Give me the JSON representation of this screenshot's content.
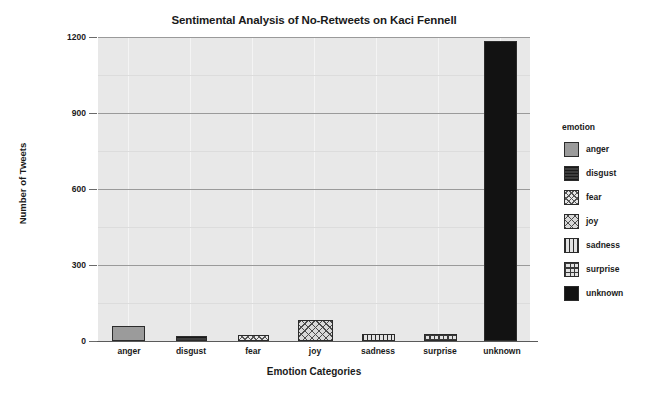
{
  "chart_data": {
    "type": "bar",
    "title": "Sentimental Analysis of No-Retweets on Kaci Fennell",
    "xlabel": "Emotion Categories",
    "ylabel": "Number of Tweets",
    "categories": [
      "anger",
      "disgust",
      "fear",
      "joy",
      "sadness",
      "surprise",
      "unknown"
    ],
    "values": [
      60,
      20,
      22,
      82,
      28,
      28,
      1185
    ],
    "ylim": [
      0,
      1200
    ],
    "yticks": [
      0,
      300,
      600,
      900,
      1200
    ],
    "ytick_labels": [
      "0",
      "300",
      "600",
      "900",
      "1200"
    ],
    "grid": true,
    "legend": {
      "title": "emotion",
      "position": "right",
      "entries": [
        {
          "label": "anger",
          "pattern": "solid-gray"
        },
        {
          "label": "disgust",
          "pattern": "horizontal-lines"
        },
        {
          "label": "fear",
          "pattern": "dots"
        },
        {
          "label": "joy",
          "pattern": "crosshatch"
        },
        {
          "label": "sadness",
          "pattern": "vertical-lines"
        },
        {
          "label": "surprise",
          "pattern": "grid"
        },
        {
          "label": "unknown",
          "pattern": "solid-black"
        }
      ]
    },
    "colors": {
      "panel_background": "#e8e8e8",
      "gridline_major": "#9a9a9a",
      "gridline_minor": "#f4f4f4",
      "bar_outline": "#2b2b2b",
      "text": "#1a1a1a"
    }
  }
}
